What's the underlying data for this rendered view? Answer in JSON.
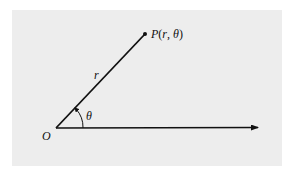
{
  "diagram": {
    "title": "",
    "labels": {
      "origin": "O",
      "point_P": "P",
      "point_open": "(",
      "point_r": "r",
      "point_comma": ", ",
      "point_theta": "θ",
      "point_close": ")",
      "radius": "r",
      "angle": "θ"
    },
    "colors": {
      "background": "#ededed",
      "ink": "#111111"
    },
    "geometry": {
      "origin": [
        56,
        128
      ],
      "point": [
        145,
        34
      ],
      "axis_end": [
        260,
        127
      ]
    }
  }
}
